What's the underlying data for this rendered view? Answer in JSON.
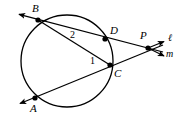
{
  "figure": {
    "type": "circle-geometry-diagram",
    "width": 185,
    "height": 118,
    "stroke_color": "#000000",
    "background_color": "#ffffff"
  },
  "circle": {
    "name": "circle",
    "cx": 67,
    "cy": 61,
    "r": 46
  },
  "points": [
    {
      "id": "B",
      "label": "B",
      "x": 38,
      "y": 20,
      "label_x": 32,
      "label_y": 3
    },
    {
      "id": "D",
      "label": "D",
      "x": 105,
      "y": 39,
      "label_x": 110,
      "label_y": 25
    },
    {
      "id": "C",
      "label": "C",
      "x": 110,
      "y": 65,
      "label_x": 114,
      "label_y": 68
    },
    {
      "id": "A",
      "label": "A",
      "x": 35,
      "y": 98,
      "label_x": 30,
      "label_y": 103
    },
    {
      "id": "P",
      "label": "P",
      "x": 148,
      "y": 48,
      "label_x": 140,
      "label_y": 30
    }
  ],
  "angles": [
    {
      "id": "1",
      "label": "1",
      "at_point": "C",
      "label_x": 90,
      "label_y": 56
    },
    {
      "id": "2",
      "label": "2",
      "at_point": "B",
      "label_x": 70,
      "label_y": 30
    }
  ],
  "lines": [
    {
      "id": "l",
      "label": "ℓ",
      "label_x": 168,
      "label_y": 33,
      "through": [
        "B",
        "D",
        "P"
      ]
    },
    {
      "id": "m",
      "label": "m",
      "label_x": 166,
      "label_y": 49,
      "through": [
        "A",
        "C",
        "P"
      ]
    }
  ],
  "segments": [
    {
      "name": "secant-b-d-p",
      "from": [
        18,
        14
      ],
      "to": [
        163,
        52
      ]
    },
    {
      "name": "secant-a-c-p",
      "from": [
        19,
        104
      ],
      "to": [
        163,
        45
      ]
    },
    {
      "name": "chord-b-c",
      "from": [
        38,
        20
      ],
      "to": [
        110,
        65
      ]
    }
  ],
  "arrows": [
    {
      "name": "arrow-at-b",
      "x": 18,
      "y": 14,
      "angle": 195
    },
    {
      "name": "arrow-at-a",
      "x": 19,
      "y": 104,
      "angle": 158
    },
    {
      "name": "arrow-line-l",
      "x": 165,
      "y": 40,
      "angle": 345
    },
    {
      "name": "arrow-line-m",
      "x": 165,
      "y": 56,
      "angle": 20
    },
    {
      "name": "arrow-p-inner-up",
      "x": 158,
      "y": 43,
      "angle": 345
    }
  ]
}
